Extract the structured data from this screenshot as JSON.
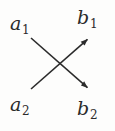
{
  "diagram": {
    "type": "crossing-arrows",
    "background_color": "#fdfdfc",
    "ink_color": "#2b2b2b",
    "stroke_width": 1.6,
    "nodes": [
      {
        "id": "a1",
        "base": "a",
        "subscript": "1",
        "position": "top-left",
        "x": 22,
        "y": 24
      },
      {
        "id": "b1",
        "base": "b",
        "subscript": "1",
        "position": "top-right",
        "x": 89,
        "y": 20
      },
      {
        "id": "a2",
        "base": "a",
        "subscript": "2",
        "position": "bottom-left",
        "x": 22,
        "y": 105
      },
      {
        "id": "b2",
        "base": "b",
        "subscript": "2",
        "position": "bottom-right",
        "x": 89,
        "y": 110
      }
    ],
    "arrows": [
      {
        "id": "a1-to-b2",
        "from": "a1",
        "to": "b2",
        "direction": "down-right",
        "x1": 31,
        "y1": 38,
        "x2": 89,
        "y2": 89,
        "arrowhead_at": "end"
      },
      {
        "id": "a2-to-b1",
        "from": "a2",
        "to": "b1",
        "direction": "up-right",
        "x1": 31,
        "y1": 89,
        "x2": 89,
        "y2": 38,
        "arrowhead_at": "end"
      }
    ],
    "crossing_point": {
      "x": 57,
      "y": 64
    }
  }
}
